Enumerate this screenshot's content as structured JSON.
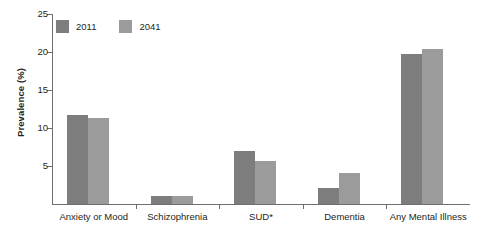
{
  "chart_data": {
    "type": "bar",
    "title": "",
    "xlabel": "",
    "ylabel": "Prevalence (%)",
    "ylim": [
      0,
      25
    ],
    "yticks": [
      5,
      10,
      15,
      20,
      25
    ],
    "grid": false,
    "legend_position": "top-left",
    "categories": [
      "Anxiety or Mood",
      "Schizophrenia",
      "SUD*",
      "Dementia",
      "Any Mental Illness"
    ],
    "series": [
      {
        "name": "2011",
        "color": "#7d7d7d",
        "values": [
          11.7,
          1.0,
          7.0,
          2.1,
          19.7
        ]
      },
      {
        "name": "2041",
        "color": "#9b9b9b",
        "values": [
          11.3,
          1.0,
          5.7,
          4.1,
          20.4
        ]
      }
    ]
  },
  "axis": {
    "y_title": "Prevalence (%)",
    "tick_labels": [
      "25",
      "20",
      "15",
      "10",
      "5"
    ]
  },
  "legend": {
    "items": [
      {
        "label": "2011",
        "color": "#7d7d7d"
      },
      {
        "label": "2041",
        "color": "#9b9b9b"
      }
    ]
  },
  "colors": {
    "series_2011": "#7d7d7d",
    "series_2041": "#9b9b9b",
    "axis": "#6f6f6f",
    "text": "#231f20",
    "background": "#ffffff"
  }
}
